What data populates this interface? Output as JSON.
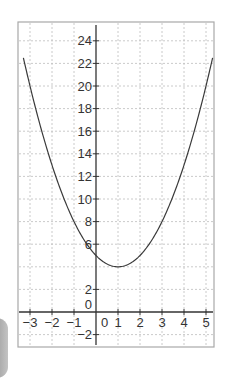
{
  "chart_data": {
    "type": "line",
    "title": "",
    "xlabel": "",
    "ylabel": "",
    "function": "y = (x - 1)^2 + 4",
    "vertex": [
      1,
      4
    ],
    "y_intercept": 5,
    "xlim": [
      -3.55,
      5.35
    ],
    "ylim": [
      -3.1,
      25.7
    ],
    "grid": true,
    "x_ticks": [
      -3,
      -2,
      -1,
      0,
      1,
      2,
      3,
      4,
      5
    ],
    "x_tick_labels": [
      "−3",
      "−2",
      "−1",
      "0",
      "1",
      "2",
      "3",
      "4",
      "5"
    ],
    "y_ticks": [
      -2,
      0,
      2,
      6,
      8,
      10,
      12,
      14,
      16,
      18,
      20,
      22,
      24
    ],
    "y_tick_labels": [
      "−2",
      "0",
      "2",
      "6",
      "8",
      "10",
      "12",
      "14",
      "16",
      "18",
      "20",
      "22",
      "24"
    ],
    "y_gridlines": [
      -2,
      2,
      4,
      6,
      8,
      10,
      12,
      14,
      16,
      18,
      20,
      22,
      24
    ],
    "series": [
      {
        "name": "parabola",
        "x": [
          -3.3,
          -3,
          -2,
          -1,
          0,
          1,
          2,
          3,
          4,
          5,
          5.3
        ],
        "y": [
          22.49,
          20,
          13,
          8,
          5,
          4,
          5,
          8,
          13,
          20,
          22.49
        ]
      }
    ],
    "colors": {
      "curve": "#3a3a3a",
      "axis": "#333333",
      "grid": "#bdbdbd",
      "frame": "#a8a8a8",
      "text": "#333333"
    }
  }
}
